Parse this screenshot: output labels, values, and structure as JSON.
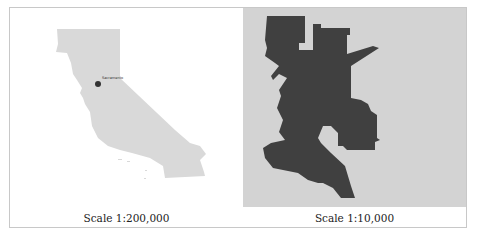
{
  "panels": [
    {
      "id": "state",
      "caption": "Scale 1:200,000",
      "region": "California",
      "marker": {
        "label": "Sacramento",
        "color": "#333333"
      },
      "fill_color": "#d9d9d9",
      "background": "#ffffff"
    },
    {
      "id": "city",
      "caption": "Scale 1:10,000",
      "region": "Sacramento",
      "fill_color": "#404040",
      "background": "#d3d3d3"
    }
  ]
}
